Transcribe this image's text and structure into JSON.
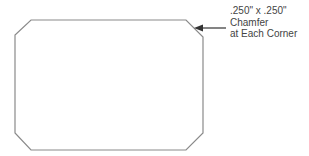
{
  "diagram": {
    "shape": "chamfered-rectangle",
    "stroke_color": "#8a8a8a",
    "arrow_color": "#333333",
    "callout": {
      "lines": [
        ".250\" x .250\"",
        "Chamfer",
        "at Each Corner"
      ]
    }
  }
}
